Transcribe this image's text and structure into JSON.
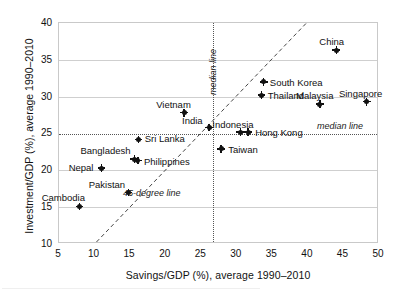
{
  "chart_data": {
    "type": "scatter",
    "title": "",
    "xlabel": "Savings/GDP (%), average 1990–2010",
    "ylabel": "Investment/GDP (%), average 1990–2010",
    "xlim": [
      5,
      50
    ],
    "ylim": [
      10,
      40
    ],
    "xticks": [
      5,
      10,
      15,
      20,
      25,
      30,
      35,
      40,
      45,
      50
    ],
    "yticks": [
      10,
      15,
      20,
      25,
      30,
      35,
      40
    ],
    "grid": "horizontal",
    "legend": "none",
    "points": [
      {
        "label": "Cambodia",
        "x": 7.9,
        "y": 15.1,
        "label_dx": -38,
        "label_dy": -13
      },
      {
        "label": "Nepal",
        "x": 11.0,
        "y": 20.3,
        "label_dx": -33,
        "label_dy": -5
      },
      {
        "label": "Pakistan",
        "x": 14.8,
        "y": 17.0,
        "label_dx": -40,
        "label_dy": -12
      },
      {
        "label": "Bangladesh",
        "x": 15.6,
        "y": 21.5,
        "label_dx": -54,
        "label_dy": -13
      },
      {
        "label": "Philippines",
        "x": 16.1,
        "y": 21.3,
        "label_dx": 6,
        "label_dy": -4
      },
      {
        "label": "Sri Lanka",
        "x": 16.2,
        "y": 24.2,
        "label_dx": 6,
        "label_dy": -5
      },
      {
        "label": "Vietnam",
        "x": 22.6,
        "y": 27.8,
        "label_dx": -28,
        "label_dy": -13
      },
      {
        "label": "India",
        "x": 26.1,
        "y": 25.8,
        "label_dx": -27,
        "label_dy": -12
      },
      {
        "label": "Indonesia",
        "x": 30.5,
        "y": 25.2,
        "label_dx": -28,
        "label_dy": -12
      },
      {
        "label": "Hong Kong",
        "x": 31.6,
        "y": 25.2,
        "label_dx": 7,
        "label_dy": -4
      },
      {
        "label": "Taiwan",
        "x": 27.8,
        "y": 22.9,
        "label_dx": 7,
        "label_dy": -4
      },
      {
        "label": "Thailand",
        "x": 33.5,
        "y": 30.2,
        "label_dx": 6,
        "label_dy": -4
      },
      {
        "label": "South Korea",
        "x": 33.8,
        "y": 32.0,
        "label_dx": 6,
        "label_dy": -4
      },
      {
        "label": "Malaysia",
        "x": 41.7,
        "y": 29.0,
        "label_dx": -24,
        "label_dy": -13
      },
      {
        "label": "Singapore",
        "x": 48.3,
        "y": 29.3,
        "label_dx": -28,
        "label_dy": -13
      },
      {
        "label": "China",
        "x": 44.0,
        "y": 36.3,
        "label_dx": -17,
        "label_dy": -13
      }
    ],
    "reference_lines": [
      {
        "name": "median-vertical",
        "type": "vertical",
        "value": 26.7,
        "style": "dotted",
        "annotation": "median line"
      },
      {
        "name": "median-horizontal",
        "type": "horizontal",
        "value": 25.0,
        "style": "dotted",
        "annotation": "median line"
      },
      {
        "name": "forty-five-degree",
        "type": "diagonal",
        "style": "dashed",
        "annotation": "45-degree line",
        "from": {
          "x": 10.3,
          "y": 10.0
        },
        "to": {
          "x": 40.0,
          "y": 40.0
        }
      }
    ]
  },
  "annotations": {
    "median_vertical_label": "median line",
    "median_horizontal_label": "median line",
    "diagonal_label": "45-degree line"
  },
  "colors": {
    "marker": "#111111",
    "axis": "#c9c9c9",
    "gridline": "#cfcfcf",
    "reference": "#555555",
    "text": "#111111",
    "background": "#ffffff"
  }
}
